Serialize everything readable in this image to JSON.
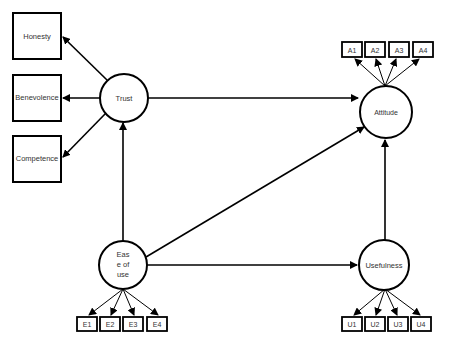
{
  "diagram": {
    "type": "structural-equation-model",
    "latent_constructs": {
      "trust": "Trust",
      "attitude": "Attitude",
      "ease_of_use": [
        "Eas",
        "e of",
        "use"
      ],
      "usefulness": "Usefulness"
    },
    "trust_dimensions": {
      "honesty": "Honesty",
      "benevolence": "Benevolence",
      "competence": "Competence"
    },
    "indicators": {
      "attitude": [
        "A1",
        "A2",
        "A3",
        "A4"
      ],
      "ease_of_use": [
        "E1",
        "E2",
        "E3",
        "E4"
      ],
      "usefulness": [
        "U1",
        "U2",
        "U3",
        "U4"
      ]
    },
    "paths": [
      {
        "from": "Trust",
        "to": "Honesty"
      },
      {
        "from": "Trust",
        "to": "Benevolence"
      },
      {
        "from": "Trust",
        "to": "Competence"
      },
      {
        "from": "Trust",
        "to": "Attitude"
      },
      {
        "from": "Ease of use",
        "to": "Trust"
      },
      {
        "from": "Ease of use",
        "to": "Attitude"
      },
      {
        "from": "Ease of use",
        "to": "Usefulness"
      },
      {
        "from": "Usefulness",
        "to": "Attitude"
      },
      {
        "from": "Attitude",
        "to": "A1..A4"
      },
      {
        "from": "Ease of use",
        "to": "E1..E4"
      },
      {
        "from": "Usefulness",
        "to": "U1..U4"
      }
    ],
    "colors": {
      "stroke": "#000000",
      "text": "#333333",
      "background": "#ffffff"
    }
  }
}
